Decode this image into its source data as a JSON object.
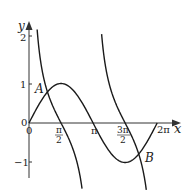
{
  "chart_data": {
    "type": "line",
    "title": "",
    "xlabel": "x",
    "ylabel": "y",
    "xlim": [
      0,
      6.2832
    ],
    "ylim": [
      -1.5,
      2.4
    ],
    "x_ticks": [
      "0",
      "π/2",
      "π",
      "3π/2",
      "2π"
    ],
    "y_ticks": [
      "2",
      "1",
      "0",
      "-1"
    ],
    "grid": false,
    "series": [
      {
        "name": "y = sin x",
        "function": "sin(x)",
        "domain": [
          0,
          6.2832
        ]
      },
      {
        "name": "y = cot x (branch 1)",
        "function": "cot(x)",
        "domain": [
          0.4,
          2.6
        ]
      },
      {
        "name": "y = cot x (branch 2)",
        "function": "cot(x)",
        "domain": [
          3.56,
          5.75
        ]
      }
    ],
    "annotations": [
      {
        "label": "A",
        "near": "intersection of sin x and cot x in (0, π/2)"
      },
      {
        "label": "B",
        "near": "intersection of sin x and cot x in (3π/2, 2π)"
      }
    ]
  },
  "labels": {
    "x_axis": "x",
    "y_axis": "y",
    "origin": "0",
    "y_origin": "0",
    "tick_pi_half_num": "π",
    "tick_pi_half_den": "2",
    "tick_pi": "π",
    "tick_3pi_half_num": "3π",
    "tick_3pi_half_den": "2",
    "tick_2pi": "2π",
    "y_tick_2": "2",
    "y_tick_1": "1",
    "y_tick_neg1": "−1",
    "point_A": "A",
    "point_B": "B"
  },
  "colors": {
    "curve": "#1a1a1a",
    "axis": "#333333"
  }
}
